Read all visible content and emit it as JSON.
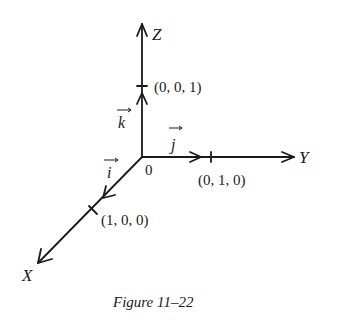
{
  "diagram": {
    "axes": {
      "x_label": "X",
      "y_label": "Y",
      "z_label": "Z",
      "origin_label": "0"
    },
    "unit_vectors": {
      "i": "i",
      "j": "j",
      "k": "k"
    },
    "points": {
      "x_unit": "(1, 0, 0)",
      "y_unit": "(0, 1, 0)",
      "z_unit": "(0, 0, 1)"
    },
    "caption": "Figure 11–22"
  }
}
